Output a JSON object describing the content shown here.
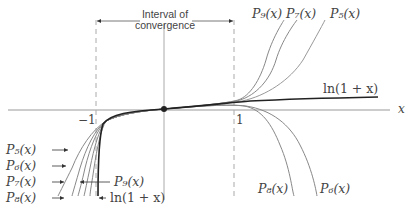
{
  "figure": {
    "interval_label_line1": "Interval of",
    "interval_label_line2": "convergence",
    "x_axis_label": "x",
    "tick_neg1": "−1",
    "tick_pos1": "1",
    "colors": {
      "axis": "#999999",
      "ln_curve": "#222222",
      "poly_curve": "#777777",
      "dashed": "#aaaaaa",
      "text": "#444444"
    },
    "curves": [
      {
        "name": "ln(1+x)",
        "label": "ln(1 + x)",
        "style": "thick-dark"
      },
      {
        "name": "P5",
        "label": "P₅(x)"
      },
      {
        "name": "P6",
        "label": "P₆(x)"
      },
      {
        "name": "P7",
        "label": "P₇(x)"
      },
      {
        "name": "P8",
        "label": "P₈(x)"
      },
      {
        "name": "P9",
        "label": "P₉(x)"
      }
    ],
    "labels": {
      "top_p9": "P₉(x)",
      "top_p7": "P₇(x)",
      "top_p5": "P₅(x)",
      "right_ln": "ln(1 + x)",
      "bottom_p8": "P₈(x)",
      "bottom_p6": "P₆(x)",
      "left_p5": "P₅(x)",
      "left_p6": "P₆(x)",
      "left_p7": "P₇(x)",
      "left_p8": "P₈(x)",
      "left_p9": "P₉(x)",
      "left_ln": "ln(1 + x)"
    }
  }
}
